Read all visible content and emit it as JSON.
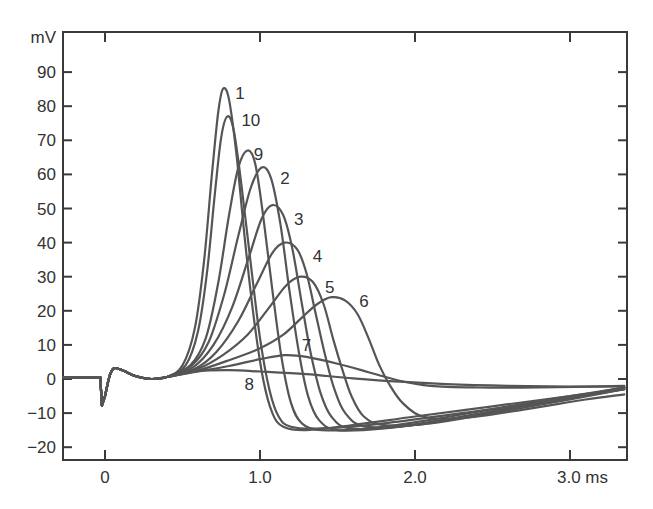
{
  "chart_data": {
    "type": "line",
    "title": "",
    "xlabel": "ms",
    "ylabel": "mV",
    "xlim": [
      -0.27,
      3.35
    ],
    "ylim": [
      -24,
      102
    ],
    "grid": false,
    "legend": "inline curve number labels",
    "x_ticks": [
      {
        "value": 0,
        "label": "0"
      },
      {
        "value": 1.0,
        "label": "1.0"
      },
      {
        "value": 2.0,
        "label": "2.0"
      },
      {
        "value": 3.0,
        "label": "3.0 ms"
      }
    ],
    "y_ticks": [
      {
        "value": 90,
        "label": "90"
      },
      {
        "value": 80,
        "label": "80"
      },
      {
        "value": 70,
        "label": "70"
      },
      {
        "value": 60,
        "label": "60"
      },
      {
        "value": 50,
        "label": "50"
      },
      {
        "value": 40,
        "label": "40"
      },
      {
        "value": 30,
        "label": "30"
      },
      {
        "value": 20,
        "label": "20"
      },
      {
        "value": 10,
        "label": "10"
      },
      {
        "value": 0,
        "label": "0"
      },
      {
        "value": -10,
        "label": "-10"
      },
      {
        "value": -20,
        "label": "-20"
      }
    ],
    "y_unit_label": "mV",
    "common_prefix": [
      [
        -0.27,
        0.5
      ],
      [
        -0.03,
        0.5
      ],
      [
        -0.02,
        -7.8
      ],
      [
        0.0,
        -5
      ],
      [
        0.03,
        1
      ],
      [
        0.06,
        3.2
      ],
      [
        0.12,
        2.4
      ],
      [
        0.2,
        0.8
      ],
      [
        0.3,
        0
      ],
      [
        0.4,
        0.6
      ]
    ],
    "series": [
      {
        "name": "1",
        "peak": {
          "t": 0.76,
          "v": 85
        },
        "label_pos": {
          "t": 0.84,
          "v": 84
        },
        "points": [
          [
            0.4,
            0.6
          ],
          [
            0.5,
            4
          ],
          [
            0.58,
            15
          ],
          [
            0.64,
            35
          ],
          [
            0.69,
            60
          ],
          [
            0.73,
            78
          ],
          [
            0.76,
            85
          ],
          [
            0.8,
            82
          ],
          [
            0.85,
            65
          ],
          [
            0.9,
            42
          ],
          [
            0.96,
            18
          ],
          [
            1.02,
            0
          ],
          [
            1.08,
            -10
          ],
          [
            1.15,
            -14
          ],
          [
            1.3,
            -15
          ],
          [
            1.6,
            -13.5
          ],
          [
            2.0,
            -11
          ],
          [
            2.5,
            -8
          ],
          [
            3.0,
            -5
          ],
          [
            3.35,
            -3
          ]
        ]
      },
      {
        "name": "10",
        "peak": {
          "t": 0.79,
          "v": 77
        },
        "label_pos": {
          "t": 0.88,
          "v": 76
        },
        "points": [
          [
            0.4,
            0.6
          ],
          [
            0.52,
            4
          ],
          [
            0.6,
            14
          ],
          [
            0.66,
            32
          ],
          [
            0.71,
            55
          ],
          [
            0.75,
            71
          ],
          [
            0.79,
            77
          ],
          [
            0.83,
            73
          ],
          [
            0.88,
            57
          ],
          [
            0.94,
            34
          ],
          [
            1.0,
            12
          ],
          [
            1.06,
            -3
          ],
          [
            1.12,
            -11
          ],
          [
            1.2,
            -14
          ],
          [
            1.4,
            -14.5
          ],
          [
            1.8,
            -13
          ],
          [
            2.3,
            -10
          ],
          [
            2.8,
            -7
          ],
          [
            3.35,
            -3
          ]
        ]
      },
      {
        "name": "9",
        "peak": {
          "t": 0.92,
          "v": 67
        },
        "label_pos": {
          "t": 0.96,
          "v": 66
        },
        "points": [
          [
            0.4,
            0.6
          ],
          [
            0.55,
            4
          ],
          [
            0.65,
            12
          ],
          [
            0.73,
            28
          ],
          [
            0.8,
            48
          ],
          [
            0.86,
            62
          ],
          [
            0.92,
            67
          ],
          [
            0.97,
            63
          ],
          [
            1.02,
            48
          ],
          [
            1.08,
            26
          ],
          [
            1.14,
            6
          ],
          [
            1.2,
            -7
          ],
          [
            1.27,
            -13
          ],
          [
            1.4,
            -15
          ],
          [
            1.7,
            -14.5
          ],
          [
            2.1,
            -12
          ],
          [
            2.6,
            -8
          ],
          [
            3.35,
            -2.5
          ]
        ]
      },
      {
        "name": "2",
        "peak": {
          "t": 1.01,
          "v": 62
        },
        "label_pos": {
          "t": 1.13,
          "v": 59
        },
        "points": [
          [
            0.4,
            0.6
          ],
          [
            0.56,
            4
          ],
          [
            0.67,
            11
          ],
          [
            0.77,
            25
          ],
          [
            0.86,
            42
          ],
          [
            0.94,
            56
          ],
          [
            1.01,
            62
          ],
          [
            1.07,
            59
          ],
          [
            1.13,
            46
          ],
          [
            1.19,
            26
          ],
          [
            1.25,
            8
          ],
          [
            1.31,
            -5
          ],
          [
            1.38,
            -12
          ],
          [
            1.5,
            -15
          ],
          [
            1.8,
            -14.5
          ],
          [
            2.2,
            -12
          ],
          [
            2.7,
            -8
          ],
          [
            3.35,
            -2.5
          ]
        ]
      },
      {
        "name": "3",
        "peak": {
          "t": 1.08,
          "v": 51
        },
        "label_pos": {
          "t": 1.22,
          "v": 47
        },
        "points": [
          [
            0.4,
            0.6
          ],
          [
            0.57,
            3.5
          ],
          [
            0.7,
            10
          ],
          [
            0.82,
            21
          ],
          [
            0.93,
            36
          ],
          [
            1.01,
            47
          ],
          [
            1.08,
            51
          ],
          [
            1.15,
            48
          ],
          [
            1.21,
            38
          ],
          [
            1.27,
            22
          ],
          [
            1.33,
            7
          ],
          [
            1.39,
            -4
          ],
          [
            1.46,
            -11
          ],
          [
            1.58,
            -14.5
          ],
          [
            1.9,
            -14
          ],
          [
            2.3,
            -11
          ],
          [
            2.8,
            -7
          ],
          [
            3.35,
            -2.5
          ]
        ]
      },
      {
        "name": "4",
        "peak": {
          "t": 1.16,
          "v": 40
        },
        "label_pos": {
          "t": 1.34,
          "v": 36
        },
        "points": [
          [
            0.4,
            0.6
          ],
          [
            0.58,
            3
          ],
          [
            0.72,
            8
          ],
          [
            0.86,
            17
          ],
          [
            0.98,
            28
          ],
          [
            1.08,
            37
          ],
          [
            1.16,
            40
          ],
          [
            1.24,
            38
          ],
          [
            1.3,
            31
          ],
          [
            1.36,
            19
          ],
          [
            1.42,
            7
          ],
          [
            1.48,
            -3
          ],
          [
            1.55,
            -10
          ],
          [
            1.68,
            -14
          ],
          [
            2.0,
            -13.5
          ],
          [
            2.4,
            -10.5
          ],
          [
            2.9,
            -6.5
          ],
          [
            3.35,
            -2.5
          ]
        ]
      },
      {
        "name": "5",
        "peak": {
          "t": 1.26,
          "v": 30
        },
        "label_pos": {
          "t": 1.42,
          "v": 27
        },
        "points": [
          [
            0.4,
            0.6
          ],
          [
            0.6,
            3
          ],
          [
            0.76,
            7
          ],
          [
            0.92,
            13
          ],
          [
            1.06,
            21
          ],
          [
            1.17,
            27.5
          ],
          [
            1.26,
            30
          ],
          [
            1.34,
            28.5
          ],
          [
            1.41,
            22
          ],
          [
            1.47,
            12
          ],
          [
            1.53,
            3
          ],
          [
            1.59,
            -5
          ],
          [
            1.67,
            -11
          ],
          [
            1.8,
            -13.5
          ],
          [
            2.1,
            -13
          ],
          [
            2.5,
            -10
          ],
          [
            3.0,
            -6
          ],
          [
            3.35,
            -3
          ]
        ]
      },
      {
        "name": "6",
        "peak": {
          "t": 1.46,
          "v": 24
        },
        "label_pos": {
          "t": 1.64,
          "v": 23
        },
        "points": [
          [
            0.4,
            0.6
          ],
          [
            0.6,
            2.5
          ],
          [
            0.8,
            5.5
          ],
          [
            1.0,
            9
          ],
          [
            1.15,
            13
          ],
          [
            1.27,
            18
          ],
          [
            1.37,
            22
          ],
          [
            1.46,
            24
          ],
          [
            1.55,
            23
          ],
          [
            1.63,
            19
          ],
          [
            1.7,
            12
          ],
          [
            1.77,
            4
          ],
          [
            1.84,
            -2
          ],
          [
            1.92,
            -7
          ],
          [
            2.05,
            -11
          ],
          [
            2.3,
            -11.5
          ],
          [
            2.7,
            -9
          ],
          [
            3.1,
            -6
          ],
          [
            3.35,
            -4.5
          ]
        ]
      },
      {
        "name": "7",
        "peak": {
          "t": 1.16,
          "v": 7
        },
        "label_pos": {
          "t": 1.27,
          "v": 10
        },
        "points": [
          [
            0.4,
            0.6
          ],
          [
            0.6,
            2.2
          ],
          [
            0.8,
            3.8
          ],
          [
            1.0,
            5.8
          ],
          [
            1.16,
            7
          ],
          [
            1.3,
            6.5
          ],
          [
            1.5,
            4.5
          ],
          [
            1.7,
            2
          ],
          [
            1.9,
            -0.5
          ],
          [
            2.1,
            -2
          ],
          [
            2.4,
            -2.5
          ],
          [
            2.8,
            -2.5
          ],
          [
            3.35,
            -2
          ]
        ]
      },
      {
        "name": "8",
        "peak": {
          "t": 0.6,
          "v": 2.5
        },
        "label_pos": {
          "t": 0.9,
          "v": -1.5
        },
        "points": [
          [
            0.4,
            0.6
          ],
          [
            0.6,
            2.3
          ],
          [
            0.8,
            2.6
          ],
          [
            1.0,
            2.2
          ],
          [
            1.3,
            1.4
          ],
          [
            1.6,
            0.2
          ],
          [
            1.9,
            -0.8
          ],
          [
            2.2,
            -1.5
          ],
          [
            2.6,
            -2
          ],
          [
            3.0,
            -2.2
          ],
          [
            3.35,
            -2.2
          ]
        ]
      }
    ]
  }
}
